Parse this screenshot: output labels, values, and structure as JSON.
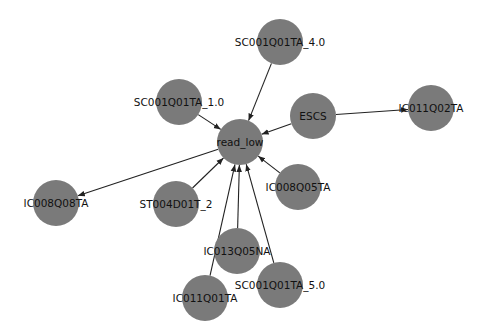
{
  "graph": {
    "type": "directed-network",
    "node_color": "#7a7a7a",
    "edge_color": "#222222",
    "node_radius": 23,
    "nodes": [
      {
        "id": "read_low",
        "label": "read_low",
        "x": 240,
        "y": 142
      },
      {
        "id": "SC001Q01TA_4.0",
        "label": "SC001Q01TA_4.0",
        "x": 280,
        "y": 42
      },
      {
        "id": "SC001Q01TA_1.0",
        "label": "SC001Q01TA_1.0",
        "x": 179,
        "y": 102
      },
      {
        "id": "ESCS",
        "label": "ESCS",
        "x": 313,
        "y": 116
      },
      {
        "id": "IC011Q02TA",
        "label": "IC011Q02TA",
        "x": 431,
        "y": 108
      },
      {
        "id": "IC008Q08TA",
        "label": "IC008Q08TA",
        "x": 56,
        "y": 203
      },
      {
        "id": "ST004D01T_2",
        "label": "ST004D01T_2",
        "x": 176,
        "y": 204
      },
      {
        "id": "IC008Q05TA",
        "label": "IC008Q05TA",
        "x": 298,
        "y": 187
      },
      {
        "id": "IC013Q05NA",
        "label": "IC013Q05NA",
        "x": 237,
        "y": 251
      },
      {
        "id": "IC011Q01TA",
        "label": "IC011Q01TA",
        "x": 205,
        "y": 298
      },
      {
        "id": "SC001Q01TA_5.0",
        "label": "SC001Q01TA_5.0",
        "x": 280,
        "y": 285
      }
    ],
    "edges": [
      {
        "from": "SC001Q01TA_4.0",
        "to": "read_low"
      },
      {
        "from": "SC001Q01TA_1.0",
        "to": "read_low"
      },
      {
        "from": "ESCS",
        "to": "read_low"
      },
      {
        "from": "ESCS",
        "to": "IC011Q02TA"
      },
      {
        "from": "read_low",
        "to": "IC008Q08TA"
      },
      {
        "from": "ST004D01T_2",
        "to": "read_low"
      },
      {
        "from": "IC008Q05TA",
        "to": "read_low"
      },
      {
        "from": "IC013Q05NA",
        "to": "read_low"
      },
      {
        "from": "IC011Q01TA",
        "to": "read_low"
      },
      {
        "from": "SC001Q01TA_5.0",
        "to": "read_low"
      }
    ]
  }
}
